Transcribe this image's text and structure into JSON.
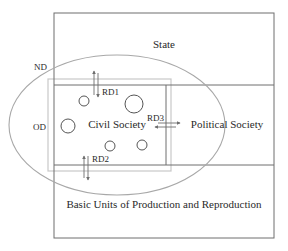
{
  "diagram": {
    "regions": {
      "state": "State",
      "political_society": "Political Society",
      "civil_society": "Civil Society",
      "basic_units": "Basic Units of Production and Reproduction"
    },
    "labels": {
      "nd": "ND",
      "od": "OD",
      "rd1": "RD1",
      "rd2": "RD2",
      "rd3": "RD3"
    },
    "colors": {
      "line": "#6e6e6e",
      "inner_box": "#c8c8c8",
      "ellipse": "#a8a8a8",
      "text": "#2a2a2a"
    }
  }
}
